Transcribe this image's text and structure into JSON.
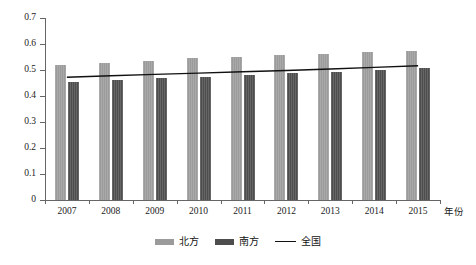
{
  "chart_data": {
    "type": "bar",
    "title": "",
    "xlabel": "年份",
    "ylabel": "",
    "ylim": [
      0,
      0.7
    ],
    "ytick_step": 0.1,
    "grid": false,
    "legend_position": "bottom-center",
    "categories": [
      "2007",
      "2008",
      "2009",
      "2010",
      "2011",
      "2012",
      "2013",
      "2014",
      "2015"
    ],
    "yticks": [
      "0",
      "0.1",
      "0.2",
      "0.3",
      "0.4",
      "0.5",
      "0.6",
      "0.7"
    ],
    "series": [
      {
        "name": "北方",
        "render": "bar",
        "color": "#9b9b9b",
        "values": [
          0.521,
          0.526,
          0.534,
          0.545,
          0.551,
          0.556,
          0.562,
          0.569,
          0.575
        ]
      },
      {
        "name": "南方",
        "render": "bar",
        "color": "#4d4d4d",
        "values": [
          0.455,
          0.461,
          0.468,
          0.475,
          0.482,
          0.487,
          0.494,
          0.501,
          0.508
        ]
      },
      {
        "name": "全国",
        "render": "line",
        "color": "#111111",
        "values": [
          0.472,
          0.478,
          0.483,
          0.488,
          0.493,
          0.498,
          0.504,
          0.51,
          0.516
        ]
      }
    ]
  },
  "legend": {
    "items": [
      {
        "label": "北方",
        "swatch": "bar-light-gray"
      },
      {
        "label": "南方",
        "swatch": "bar-dark-gray"
      },
      {
        "label": "全国",
        "swatch": "line-black"
      }
    ]
  },
  "axis": {
    "x_axis_caption": "年份"
  },
  "caption": {
    "text": ""
  },
  "colors": {
    "north_bar": "#9b9b9b",
    "south_bar": "#4d4d4d",
    "national_line": "#111111",
    "axis": "#666666",
    "background": "#ffffff"
  }
}
